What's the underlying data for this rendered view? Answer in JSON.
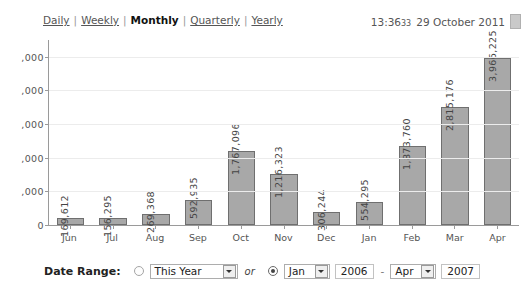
{
  "header": {
    "nav_items": [
      {
        "label": "Daily",
        "active": false
      },
      {
        "label": "Weekly",
        "active": false
      },
      {
        "label": "Monthly",
        "active": true
      },
      {
        "label": "Quarterly",
        "active": false
      },
      {
        "label": "Yearly",
        "active": false
      }
    ],
    "separator": "|",
    "time": "13:36",
    "seconds": "33",
    "date": "29 October 2011",
    "calendar_icon": "calendar-icon"
  },
  "footer": {
    "date_range_label": "Date Range:",
    "preset_radio_selected": false,
    "preset_value": "This Year",
    "or_label": "or",
    "custom_radio_selected": true,
    "from_month": "Jan",
    "from_year": "2006",
    "range_dash": "-",
    "to_month": "Apr",
    "to_year": "2007",
    "dropdown_icon": "chevron-down-icon"
  },
  "chart_data": {
    "type": "bar",
    "title": "",
    "xlabel": "",
    "ylabel": "",
    "categories": [
      "Jun",
      "Jul",
      "Aug",
      "Sep",
      "Oct",
      "Nov",
      "Dec",
      "Jan",
      "Feb",
      "Mar",
      "Apr"
    ],
    "values": [
      169612,
      156295,
      269368,
      592935,
      1767096,
      1216323,
      306244,
      554295,
      1873760,
      2815176,
      3966225
    ],
    "value_labels": [
      "169,612",
      "156,295",
      "269,368",
      "592,935",
      "1,767,096",
      "1,216,323",
      "306,244",
      "554,295",
      "1,873,760",
      "2,815,176",
      "3,966,225"
    ],
    "ylim": [
      0,
      4400000
    ],
    "yticks": [
      0,
      800000,
      1600000,
      2400000,
      3200000,
      4000000
    ],
    "ytick_labels": [
      "0",
      ",000",
      ",000",
      ",000",
      ",000",
      ",000"
    ],
    "grid": true,
    "legend": "none",
    "bar_color": "#a8a8a8",
    "bar_border_color": "#6f6f6f",
    "axis_color": "#9a9a9a",
    "grid_color": "#ececec"
  }
}
